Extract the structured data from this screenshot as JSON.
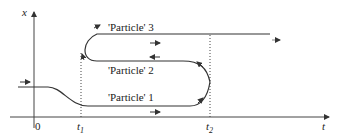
{
  "diagram": {
    "axes": {
      "x_label": "x",
      "t_label": "t",
      "origin_label": "0",
      "t1_label": "t",
      "t1_sub": "1",
      "t2_label": "t",
      "t2_sub": "2"
    },
    "particles": [
      {
        "label": "'Particle' 1"
      },
      {
        "label": "'Particle' 2"
      },
      {
        "label": "'Particle' 3"
      }
    ],
    "colors": {
      "line": "#333333",
      "background": "#ffffff"
    }
  }
}
